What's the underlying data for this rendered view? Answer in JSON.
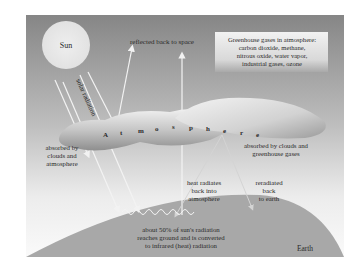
{
  "diagram": {
    "type": "greenhouse-effect",
    "sun": {
      "label": "Sun"
    },
    "solar_radiation": {
      "label": "solar radiation"
    },
    "reflected": {
      "label": "reflected back to space"
    },
    "greenhouse_box": {
      "lines": [
        "Greenhouse gases in atmosphere:",
        "carbon dioxide, methane,",
        "nitrous oxide, water vapor,",
        "industrial gases, ozone"
      ]
    },
    "atmosphere": {
      "letters": [
        "A",
        "t",
        "m",
        "o",
        "s",
        "p",
        "h",
        "e",
        "r",
        "e"
      ]
    },
    "absorbed_clouds_atmosphere": {
      "lines": [
        "absorbed by",
        "clouds and",
        "atmosphere"
      ]
    },
    "absorbed_clouds_greenhouse": {
      "lines": [
        "absorbed by clouds and",
        "greenhouse gases"
      ]
    },
    "heat_radiates": {
      "lines": [
        "heat radiates",
        "back into",
        "atmosphere"
      ]
    },
    "reradiated": {
      "lines": [
        "reradiated",
        "back",
        "to earth"
      ]
    },
    "ground": {
      "lines": [
        "about 50% of sun's radiation",
        "reaches ground and is converted",
        "to infrared (heat) radiation"
      ]
    },
    "earth": {
      "label": "Earth"
    },
    "colors": {
      "sky_top": "#8a8a8a",
      "sky_bottom": "#f6f6f6",
      "sun": "#e6e6e6",
      "earth": "#a8a8a8",
      "cloud_dark": "#9a9a9a",
      "cloud_light": "#e2e2e2",
      "ray": "#f0f0f0"
    }
  }
}
